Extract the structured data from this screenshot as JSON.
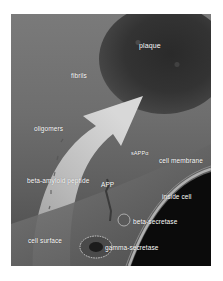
{
  "figure": {
    "type": "illustration",
    "labels": {
      "plaque": "plaque",
      "fibrils": "fibrils",
      "oligomers": "oligomers",
      "sappa": "sAPPα",
      "cell_membrane": "cell membrane",
      "beta_amyloid": "beta-amyloid peptide",
      "app": "APP",
      "inside_cell": "inside cell",
      "beta_secretase": "beta-secretase",
      "cell_surface": "cell surface",
      "gamma_secretase": "gamma-secretase"
    },
    "colors": {
      "background": "#6e6e6e",
      "plaque": "#2e2e2e",
      "arrow": "#c8c8c8",
      "inside_cell": "#0a0a0a",
      "label": "#ffffff"
    }
  }
}
